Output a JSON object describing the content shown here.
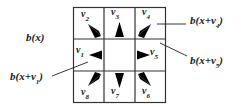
{
  "diagram": {
    "type": "3x3 neighborhood of pixel x with 8 direction vectors",
    "center_label": {
      "base": "b(x)"
    },
    "cells": [
      {
        "id": "v1",
        "label": "v",
        "sub": "1",
        "row": 1,
        "col": 0
      },
      {
        "id": "v2",
        "label": "v",
        "sub": "2",
        "row": 0,
        "col": 0
      },
      {
        "id": "v3",
        "label": "v",
        "sub": "3",
        "row": 0,
        "col": 1
      },
      {
        "id": "v4",
        "label": "v",
        "sub": "4",
        "row": 0,
        "col": 2
      },
      {
        "id": "v5",
        "label": "v",
        "sub": "5",
        "row": 1,
        "col": 2
      },
      {
        "id": "v6",
        "label": "v",
        "sub": "6",
        "row": 2,
        "col": 2
      },
      {
        "id": "v7",
        "label": "v",
        "sub": "7",
        "row": 2,
        "col": 1
      },
      {
        "id": "v8",
        "label": "v",
        "sub": "8",
        "row": 2,
        "col": 0
      }
    ],
    "callouts": [
      {
        "id": "b-x",
        "text": "b(x)"
      },
      {
        "id": "b-x-v1",
        "prefix": "b(x+v",
        "sub": "1",
        "suffix": ")"
      },
      {
        "id": "b-x-v4",
        "prefix": "b(x+v",
        "sub": "4",
        "suffix": ")"
      },
      {
        "id": "b-x-v5",
        "prefix": "b(x+v",
        "sub": "5",
        "suffix": ")"
      }
    ],
    "colors": {
      "grid": "#333333",
      "wedge": "#000000",
      "text": "#1a1a1a"
    }
  }
}
